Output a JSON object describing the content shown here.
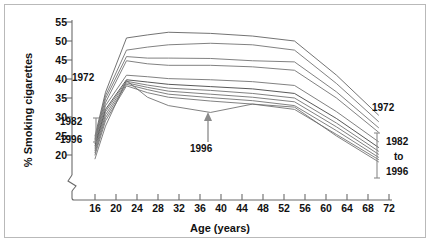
{
  "chart_data": {
    "type": "line",
    "title": "",
    "xlabel": "Age (years)",
    "ylabel": "% Smoking cigarettes",
    "xlim": [
      14,
      73
    ],
    "ylim": [
      18,
      56
    ],
    "ytick_values": [
      20,
      25,
      30,
      35,
      40,
      45,
      50,
      55
    ],
    "ytick_labels": [
      "20",
      "25",
      "30",
      "35",
      "40",
      "45",
      "50",
      "55"
    ],
    "xtick_values": [
      16,
      20,
      24,
      28,
      32,
      36,
      40,
      44,
      48,
      52,
      56,
      60,
      64,
      68,
      72
    ],
    "xtick_labels": [
      "16",
      "20",
      "24",
      "28",
      "32",
      "36",
      "40",
      "44",
      "48",
      "52",
      "56",
      "60",
      "64",
      "68",
      "72"
    ],
    "grid": false,
    "legend_position": "none",
    "axis_break": true,
    "axis_break_note": "y-axis broken below 20",
    "x": [
      16,
      18,
      22,
      26,
      30,
      38,
      46,
      54,
      62,
      70
    ],
    "series": [
      {
        "name": "1972",
        "color": "#5a5a5a",
        "values": [
          25.0,
          36.5,
          50.8,
          51.6,
          52.3,
          52.0,
          51.3,
          50.0,
          41.0,
          30.5
        ]
      },
      {
        "name": "1974",
        "color": "#6a6a6a",
        "values": [
          24.4,
          35.6,
          47.6,
          48.4,
          49.0,
          49.4,
          49.0,
          47.6,
          38.8,
          28.8
        ]
      },
      {
        "name": "1976",
        "color": "#6a6a6a",
        "values": [
          24.0,
          34.8,
          45.9,
          45.5,
          45.5,
          45.4,
          44.8,
          44.5,
          36.6,
          27.2
        ]
      },
      {
        "name": "1978",
        "color": "#6a6a6a",
        "values": [
          23.6,
          33.8,
          44.8,
          44.0,
          43.6,
          43.6,
          43.2,
          42.3,
          35.0,
          26.0
        ]
      },
      {
        "name": "1980",
        "color": "#6a6a6a",
        "values": [
          23.0,
          33.0,
          41.0,
          40.6,
          40.1,
          39.8,
          39.3,
          38.3,
          31.4,
          23.5
        ]
      },
      {
        "name": "1982",
        "color": "#3a3a3a",
        "values": [
          22.4,
          32.0,
          39.8,
          39.2,
          38.6,
          38.0,
          37.4,
          36.2,
          29.6,
          22.0
        ]
      },
      {
        "name": "1984",
        "color": "#6a6a6a",
        "values": [
          21.8,
          31.4,
          39.4,
          38.4,
          37.6,
          37.0,
          36.2,
          35.0,
          28.4,
          21.0
        ]
      },
      {
        "name": "1986",
        "color": "#6a6a6a",
        "values": [
          21.2,
          30.6,
          39.0,
          37.8,
          36.8,
          36.0,
          35.2,
          34.0,
          27.4,
          20.2
        ]
      },
      {
        "name": "1988",
        "color": "#6a6a6a",
        "values": [
          20.6,
          29.8,
          38.6,
          37.2,
          36.0,
          35.1,
          34.3,
          33.0,
          26.4,
          19.4
        ]
      },
      {
        "name": "1990",
        "color": "#6a6a6a",
        "values": [
          20.0,
          29.0,
          38.2,
          36.4,
          35.2,
          34.2,
          33.4,
          32.0,
          25.4,
          18.8
        ]
      },
      {
        "name": "1996",
        "color": "#6a6a6a",
        "values": [
          19.0,
          27.6,
          39.6,
          35.2,
          33.0,
          31.2,
          33.4,
          32.6,
          25.0,
          18.2
        ]
      }
    ]
  },
  "annotations": {
    "left_top": "1972",
    "left_bracket_top": "1982",
    "left_bracket_bottom": "1996",
    "middle_arrow": "1996",
    "right_top": "1972",
    "right_bracket_line1": "1982",
    "right_bracket_line2": "to",
    "right_bracket_line3": "1996"
  }
}
